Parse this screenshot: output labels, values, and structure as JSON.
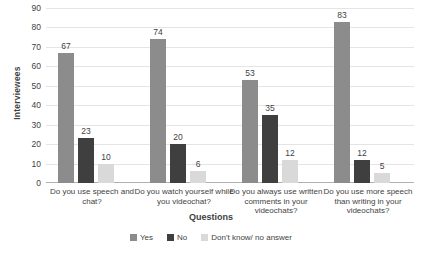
{
  "chart_data": {
    "type": "bar",
    "title": "",
    "xlabel": "Questions",
    "ylabel": "Interviewees",
    "ylim": [
      0,
      90
    ],
    "ytick_step": 10,
    "yticks": [
      0,
      10,
      20,
      30,
      40,
      50,
      60,
      70,
      80,
      90
    ],
    "grid": true,
    "legend_position": "bottom",
    "categories": [
      "Do you use speech and chat?",
      "Do you watch yourself while you videochat?",
      "Do you always use written comments in your videochats?",
      "Do you use more speech than writing in your videochats?"
    ],
    "series": [
      {
        "name": "Yes",
        "color": "#8c8c8c",
        "values": [
          67,
          74,
          53,
          83
        ]
      },
      {
        "name": "No",
        "color": "#3f3f3f",
        "values": [
          23,
          20,
          35,
          12
        ]
      },
      {
        "name": "Don't know/ no answer",
        "color": "#d9d9d9",
        "values": [
          10,
          6,
          12,
          5
        ]
      }
    ]
  },
  "legend": {
    "items": [
      {
        "label": "Yes",
        "color": "#8c8c8c"
      },
      {
        "label": "No",
        "color": "#3f3f3f"
      },
      {
        "label": "Don't know/ no answer",
        "color": "#d9d9d9"
      }
    ]
  },
  "axes": {
    "y_title": "Interviewees",
    "x_title": "Questions"
  }
}
